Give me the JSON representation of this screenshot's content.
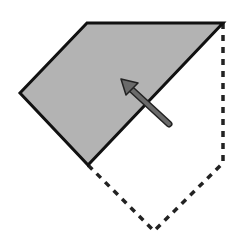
{
  "diagram": {
    "colors": {
      "background": "#ffffff",
      "flap_fill": "#b3b3b3",
      "outline": "#111111",
      "arrow_fill": "#6a6a6a",
      "arrow_stroke": "#222222",
      "dashed": "#222222"
    },
    "shaded_flap": {
      "points": [
        [
          87,
          23
        ],
        [
          223,
          23
        ],
        [
          88,
          165
        ],
        [
          20,
          93
        ]
      ]
    },
    "dashed_outline": {
      "points": [
        [
          223,
          23
        ],
        [
          223,
          163
        ],
        [
          154,
          231
        ],
        [
          88,
          165
        ]
      ]
    },
    "arrow": {
      "tail": [
        169,
        124
      ],
      "tip": [
        122,
        81
      ],
      "direction": "up-left"
    }
  }
}
